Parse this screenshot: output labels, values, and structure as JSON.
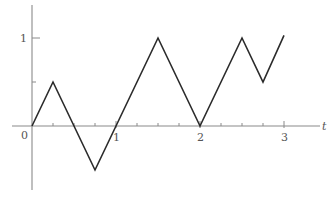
{
  "chart_data": {
    "type": "line",
    "title": "",
    "xlabel": "t",
    "ylabel": "",
    "x_tick_labels": [
      "0",
      "1",
      "2",
      "3"
    ],
    "y_tick_labels": [
      "1"
    ],
    "x_minor_ticks": [
      0.25,
      0.5,
      0.75,
      1,
      1.25,
      1.5,
      1.75,
      2,
      2.25,
      2.5,
      2.75,
      3
    ],
    "y_minor_ticks": [
      0.5,
      1
    ],
    "xlim": [
      -0.35,
      3.45
    ],
    "ylim": [
      -1.05,
      1.37
    ],
    "grid": false,
    "legend": null,
    "series": [
      {
        "name": "piecewise-linear path",
        "x": [
          0,
          0.25,
          0.75,
          1.5,
          2,
          2.5,
          2.75,
          3
        ],
        "y": [
          0,
          0.5,
          -0.5,
          1,
          0,
          1,
          0.5,
          1.03
        ]
      }
    ]
  },
  "axes": {
    "origin_label": "0",
    "x_axis_label": "t",
    "line_color": "#8a8a8a",
    "curve_color": "#2b2b2b"
  }
}
